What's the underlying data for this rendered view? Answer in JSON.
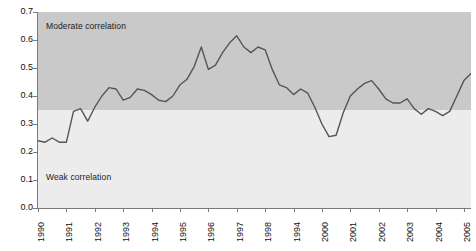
{
  "chart_data": {
    "type": "line",
    "title": "",
    "subtitle": "",
    "xlabel": "",
    "ylabel": "",
    "xlim": [
      1990,
      2005.25
    ],
    "ylim": [
      0.0,
      0.7
    ],
    "grid": false,
    "legend": "none",
    "y_ticks": [
      "0.0",
      "0.1",
      "0.2",
      "0.3",
      "0.4",
      "0.5",
      "0.6",
      "0.7"
    ],
    "y_tick_values": [
      0.0,
      0.1,
      0.2,
      0.3,
      0.4,
      0.5,
      0.6,
      0.7
    ],
    "x_ticks": [
      "1990",
      "1991",
      "1992",
      "1993",
      "1994",
      "1995",
      "1996",
      "1997",
      "1998",
      "1994",
      "2000",
      "2001",
      "2002",
      "2003",
      "2004",
      "2005"
    ],
    "x_tick_values": [
      1990,
      1991,
      1992,
      1993,
      1994,
      1995,
      1996,
      1997,
      1998,
      1999,
      2000,
      2001,
      2002,
      2003,
      2004,
      2005
    ],
    "bands": [
      {
        "name": "moderate-correlation",
        "label": "Moderate correlation",
        "y_from": 0.35,
        "y_to": 0.7,
        "color": "#c9c9c9"
      },
      {
        "name": "weak-correlation",
        "label": "Weak correlation",
        "y_from": 0.0,
        "y_to": 0.35,
        "color": "#ececec"
      }
    ],
    "series": [
      {
        "name": "correlation",
        "color": "#555555",
        "x": [
          1990.0,
          1990.25,
          1990.5,
          1990.75,
          1991.0,
          1991.25,
          1991.5,
          1991.75,
          1992.0,
          1992.25,
          1992.5,
          1992.75,
          1993.0,
          1993.25,
          1993.5,
          1993.75,
          1994.0,
          1994.25,
          1994.5,
          1994.75,
          1995.0,
          1995.25,
          1995.5,
          1995.75,
          1996.0,
          1996.25,
          1996.5,
          1996.75,
          1997.0,
          1997.25,
          1997.5,
          1997.75,
          1998.0,
          1998.25,
          1998.5,
          1998.75,
          1999.0,
          1999.25,
          1999.5,
          1999.75,
          2000.0,
          2000.25,
          2000.5,
          2000.75,
          2001.0,
          2001.25,
          2001.5,
          2001.75,
          2002.0,
          2002.25,
          2002.5,
          2002.75,
          2003.0,
          2003.25,
          2003.5,
          2003.75,
          2004.0,
          2004.25,
          2004.5,
          2004.75,
          2005.0,
          2005.25
        ],
        "values": [
          0.24,
          0.235,
          0.25,
          0.235,
          0.235,
          0.345,
          0.355,
          0.31,
          0.36,
          0.4,
          0.43,
          0.425,
          0.385,
          0.395,
          0.425,
          0.42,
          0.405,
          0.385,
          0.38,
          0.4,
          0.44,
          0.46,
          0.505,
          0.575,
          0.495,
          0.51,
          0.555,
          0.59,
          0.615,
          0.575,
          0.555,
          0.575,
          0.565,
          0.495,
          0.44,
          0.43,
          0.405,
          0.425,
          0.41,
          0.36,
          0.3,
          0.255,
          0.26,
          0.34,
          0.4,
          0.425,
          0.445,
          0.455,
          0.425,
          0.39,
          0.375,
          0.375,
          0.39,
          0.355,
          0.335,
          0.355,
          0.345,
          0.33,
          0.345,
          0.4,
          0.455,
          0.48
        ]
      }
    ]
  }
}
